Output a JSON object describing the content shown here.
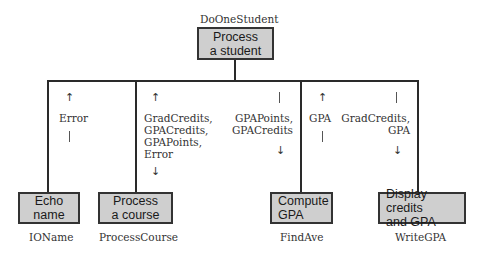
{
  "root": {
    "module_name": "DoOneStudent",
    "label_line1": "Process",
    "label_line2": "a student"
  },
  "children": [
    {
      "module_name": "IOName",
      "label_line1": "Echo",
      "label_line2": "name",
      "params_up": [
        "Error"
      ],
      "params_down": []
    },
    {
      "module_name": "ProcessCourse",
      "label_line1": "Process",
      "label_line2": "a course",
      "params_bidirectional": [
        "GradCredits,",
        "GPACredits,",
        "GPAPoints,",
        "Error"
      ]
    },
    {
      "module_name": "FindAve",
      "label_line1": "Compute",
      "label_line2": "GPA",
      "params_down": [
        "GPAPoints,",
        "GPACredits"
      ],
      "params_up": [
        "GPA"
      ]
    },
    {
      "module_name": "WriteGPA",
      "label_line1": "Display credits",
      "label_line2": "and GPA",
      "params_down": [
        "GradCredits,",
        "GPA"
      ]
    }
  ],
  "colors": {
    "box_fill": "#cfcfcf",
    "line": "#2a2a2a"
  }
}
